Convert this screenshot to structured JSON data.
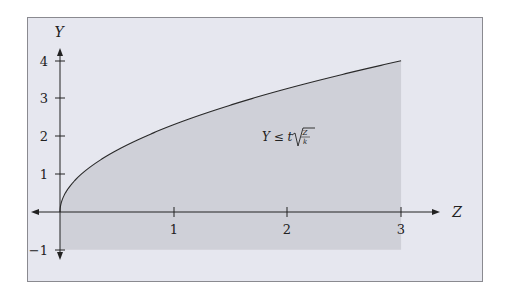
{
  "chart_data": {
    "type": "area",
    "title": "",
    "xlabel": "Z",
    "ylabel": "Y",
    "xlim": [
      -0.25,
      3.15
    ],
    "ylim": [
      -1.1,
      4.2
    ],
    "x_ticks": [
      1,
      2,
      3
    ],
    "x_tick_labels": [
      "1",
      "2",
      "3"
    ],
    "y_ticks": [
      -1,
      1,
      2,
      3,
      4
    ],
    "y_tick_labels": [
      "−1",
      "1",
      "2",
      "3",
      "4"
    ],
    "grid": false,
    "legend": null,
    "series": [
      {
        "name": "Y = t·sqrt(Z/k) boundary",
        "function": "Y = 4*sqrt(Z/3)",
        "x": [
          0,
          0.05,
          0.1,
          0.25,
          0.5,
          0.75,
          1,
          1.5,
          2,
          2.5,
          3
        ],
        "values": [
          0,
          0.52,
          0.73,
          1.15,
          1.63,
          2.0,
          2.31,
          2.83,
          3.27,
          3.65,
          4.0
        ]
      }
    ],
    "shaded_region": {
      "description": "Region between Y = -1 and the curve for 0 ≤ Z ≤ 3",
      "x_range": [
        0,
        3
      ],
      "y_lower": -1,
      "y_upper": "curve"
    },
    "annotations": [
      {
        "text": "Y ≤ t√(Z/k)",
        "x": 1.9,
        "y": 2.0
      }
    ]
  },
  "labels": {
    "x_axis": "Z",
    "y_axis": "Y",
    "annotation_lhs": "Y ≤ t",
    "annotation_num": "Z",
    "annotation_den": "k",
    "xt1": "1",
    "xt2": "2",
    "xt3": "3",
    "yt4": "4",
    "yt3": "3",
    "yt2": "2",
    "yt1": "1",
    "ytm1": "−1"
  },
  "colors": {
    "frame_bg": "#e6e7ef",
    "shade": "#cfd0d8",
    "axis": "#222222"
  }
}
